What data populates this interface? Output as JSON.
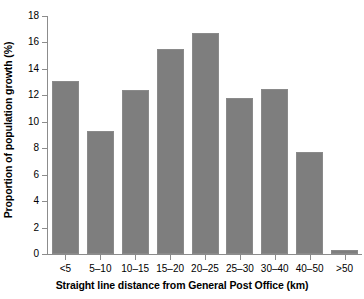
{
  "chart_data": {
    "type": "bar",
    "title": "",
    "subtitle": "",
    "xlabel": "Straight line distance from General Post Office (km)",
    "ylabel": "Proportion of population growth (%)",
    "categories": [
      "<5",
      "5–10",
      "10–15",
      "15–20",
      "20–25",
      "25–30",
      "30–40",
      "40–50",
      ">50"
    ],
    "values": [
      13.1,
      9.3,
      12.4,
      15.5,
      16.7,
      11.8,
      12.5,
      7.7,
      0.3
    ],
    "ylim": [
      0,
      18
    ],
    "yticks": [
      0,
      2,
      4,
      6,
      8,
      10,
      12,
      14,
      16,
      18
    ],
    "ytick_labels": [
      "0",
      "2",
      "4",
      "6",
      "8",
      "10",
      "12",
      "14",
      "16",
      "18"
    ],
    "grid": false,
    "legend": null,
    "legend_position": "none",
    "bar_color": "#7e7e7e",
    "axis_color": "#8c8c8c",
    "background_color": "#ffffff"
  }
}
